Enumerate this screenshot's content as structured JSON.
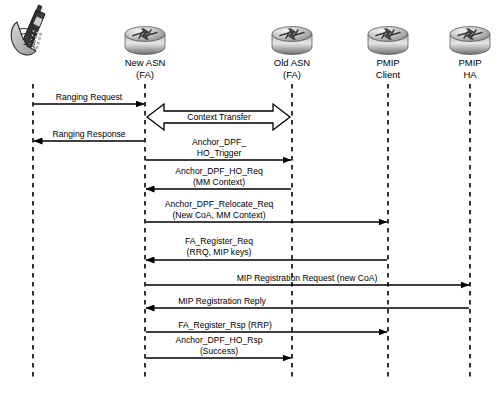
{
  "diagram": {
    "type": "sequence-diagram",
    "background_color": "#ffffff",
    "line_color": "#000000",
    "lifeline_style": "dashed"
  },
  "nodes": [
    {
      "id": "ms",
      "icon": "mobile-phone-in-hand-icon",
      "label_line1": "",
      "label_line2": "",
      "x": 33
    },
    {
      "id": "new_asn",
      "icon": "router-icon",
      "label_line1": "New ASN",
      "label_line2": "(FA)",
      "x": 145
    },
    {
      "id": "old_asn",
      "icon": "router-icon",
      "label_line1": "Old ASN",
      "label_line2": "(FA)",
      "x": 292
    },
    {
      "id": "pmip_client",
      "icon": "router-icon",
      "label_line1": "PMIP",
      "label_line2": "Client",
      "x": 388
    },
    {
      "id": "pmip_ha",
      "icon": "router-icon",
      "label_line1": "PMIP",
      "label_line2": "HA",
      "x": 470
    }
  ],
  "messages": [
    {
      "index": 1,
      "label_line1": "Ranging Request",
      "label_line2": "",
      "from": "ms",
      "to": "new_asn",
      "direction": "right",
      "style": "line-arrow",
      "y": 104,
      "label_x": 89,
      "label_y": 92
    },
    {
      "index": 2,
      "label_line1": "Context Transfer",
      "label_line2": "",
      "from": "new_asn",
      "to": "old_asn",
      "direction": "both",
      "style": "block-arrow",
      "y": 117,
      "label_x": 219,
      "label_y": 112
    },
    {
      "index": 3,
      "label_line1": "Ranging Response",
      "label_line2": "",
      "from": "new_asn",
      "to": "ms",
      "direction": "left",
      "style": "line-arrow",
      "y": 141,
      "label_x": 89,
      "label_y": 129
    },
    {
      "index": 4,
      "label_line1": "Anchor_DPF_",
      "label_line2": "HO_Trigger",
      "from": "new_asn",
      "to": "old_asn",
      "direction": "right",
      "style": "line-arrow",
      "y": 160,
      "label_x": 219,
      "label_y": 137
    },
    {
      "index": 5,
      "label_line1": "Anchor_DPF_HO_Req",
      "label_line2": "(MM Context)",
      "from": "old_asn",
      "to": "new_asn",
      "direction": "left",
      "style": "line-arrow",
      "y": 189,
      "label_x": 219,
      "label_y": 166
    },
    {
      "index": 6,
      "label_line1": "Anchor_DPF_Relocate_Req",
      "label_line2": "(New CoA, MM Context)",
      "from": "new_asn",
      "to": "pmip_client",
      "direction": "right",
      "style": "line-arrow",
      "y": 222,
      "label_x": 219,
      "label_y": 199
    },
    {
      "index": 7,
      "label_line1": "FA_Register_Req",
      "label_line2": "(RRQ, MIP keys)",
      "from": "pmip_client",
      "to": "new_asn",
      "direction": "left",
      "style": "line-arrow",
      "y": 260,
      "label_x": 219,
      "label_y": 236
    },
    {
      "index": 8,
      "label_line1": "MIP Registration Request (new CoA)",
      "label_line2": "",
      "from": "new_asn",
      "to": "pmip_ha",
      "direction": "right",
      "style": "line-arrow",
      "y": 285,
      "label_x": 307,
      "label_y": 273
    },
    {
      "index": 9,
      "label_line1": "MIP Registration Reply",
      "label_line2": "",
      "from": "pmip_ha",
      "to": "new_asn",
      "direction": "left",
      "style": "line-arrow",
      "y": 308,
      "label_x": 222,
      "label_y": 296
    },
    {
      "index": 10,
      "label_line1": "FA_Register_Rsp (RRP)",
      "label_line2": "",
      "from": "new_asn",
      "to": "pmip_client",
      "direction": "right",
      "style": "line-arrow",
      "y": 332,
      "label_x": 225,
      "label_y": 320
    },
    {
      "index": 11,
      "label_line1": "Anchor_DPF_HO_Rsp",
      "label_line2": "(Success)",
      "from": "new_asn",
      "to": "old_asn",
      "direction": "right",
      "style": "line-arrow",
      "y": 358,
      "label_x": 219,
      "label_y": 335
    }
  ]
}
